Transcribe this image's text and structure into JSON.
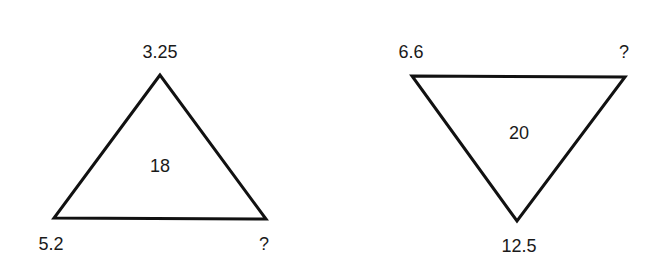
{
  "puzzle": {
    "triangles": [
      {
        "orientation": "up",
        "center_value": "18",
        "vertices": {
          "top": "3.25",
          "bottom_left": "5.2",
          "bottom_right": "?"
        }
      },
      {
        "orientation": "down",
        "center_value": "20",
        "vertices": {
          "top_left": "6.6",
          "top_right": "?",
          "bottom": "12.5"
        }
      }
    ]
  }
}
